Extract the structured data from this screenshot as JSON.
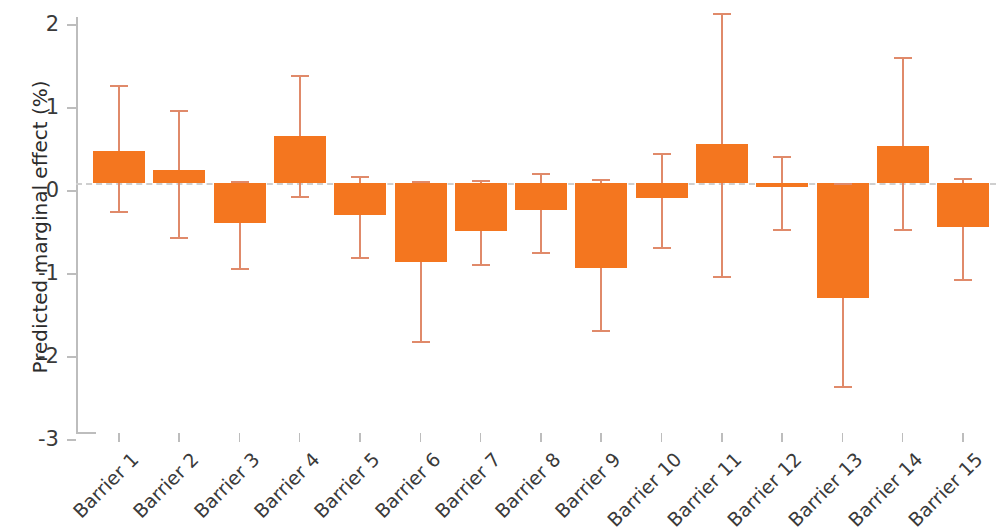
{
  "chart_data": {
    "type": "bar",
    "title": "",
    "xlabel": "",
    "ylabel": "Predicted marginal effect (%)",
    "ylim": [
      -3,
      2
    ],
    "yticks": [
      2,
      1,
      0,
      -1,
      -2,
      -3
    ],
    "ytick_labels": [
      "2",
      "1",
      "0",
      "-1",
      "-2",
      "-3"
    ],
    "grid": false,
    "legend": null,
    "baseline": 0,
    "bar_color": "#F4761F",
    "error_color": "#e08a6a",
    "categories": [
      "Barrier 1",
      "Barrier 2",
      "Barrier 3",
      "Barrier 4",
      "Barrier 5",
      "Barrier 6",
      "Barrier 7",
      "Barrier 8",
      "Barrier 9",
      "Barrier 10",
      "Barrier 11",
      "Barrier 12",
      "Barrier 13",
      "Barrier 14",
      "Barrier 15"
    ],
    "values": [
      0.39,
      0.16,
      -0.48,
      0.57,
      -0.38,
      -0.95,
      -0.58,
      -0.33,
      -1.03,
      -0.18,
      0.47,
      -0.05,
      -1.38,
      0.44,
      -0.53
    ],
    "ci_low": [
      -0.34,
      -0.65,
      -1.02,
      -0.16,
      -0.89,
      -1.9,
      -0.98,
      -0.83,
      -1.77,
      -0.77,
      -1.12,
      -0.56,
      -2.45,
      -0.56,
      -1.16
    ],
    "ci_high": [
      1.18,
      0.88,
      0.02,
      1.3,
      0.09,
      0.03,
      0.04,
      0.12,
      0.05,
      0.36,
      2.05,
      0.33,
      0.0,
      1.52,
      0.06
    ]
  }
}
